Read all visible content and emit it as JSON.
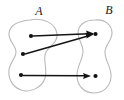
{
  "figure": {
    "kind": "set-mapping-diagram",
    "width": 124,
    "height": 100,
    "background_color": "#ffffff",
    "blob_stroke_color": "#b9b9b9",
    "dot_color": "#111111",
    "arrow_color": "#141414"
  },
  "sets": [
    {
      "id": "A",
      "label": "A",
      "label_x": 39,
      "label_y": 15,
      "elements": [
        {
          "id": "a1",
          "cx": 31,
          "cy": 36,
          "r": 2.1
        },
        {
          "id": "a2",
          "cx": 23,
          "cy": 54,
          "r": 2.1
        },
        {
          "id": "a3",
          "cx": 21,
          "cy": 75,
          "r": 2.1
        }
      ]
    },
    {
      "id": "B",
      "label": "B",
      "label_x": 109,
      "label_y": 14,
      "elements": [
        {
          "id": "b1",
          "cx": 95,
          "cy": 34,
          "r": 2.1
        },
        {
          "id": "b2",
          "cx": 95,
          "cy": 76,
          "r": 2.1
        }
      ]
    }
  ],
  "arrows": [
    {
      "id": "a1-to-b1",
      "from": "a1",
      "to": "b1",
      "x1": 33,
      "y1": 36,
      "x2": 92,
      "y2": 34
    },
    {
      "id": "a2-to-b1",
      "from": "a2",
      "to": "b1",
      "x1": 25,
      "y1": 54,
      "x2": 92,
      "y2": 35
    },
    {
      "id": "a3-to-b2",
      "from": "a3",
      "to": "b2",
      "x1": 23,
      "y1": 75,
      "x2": 92,
      "y2": 76
    }
  ]
}
